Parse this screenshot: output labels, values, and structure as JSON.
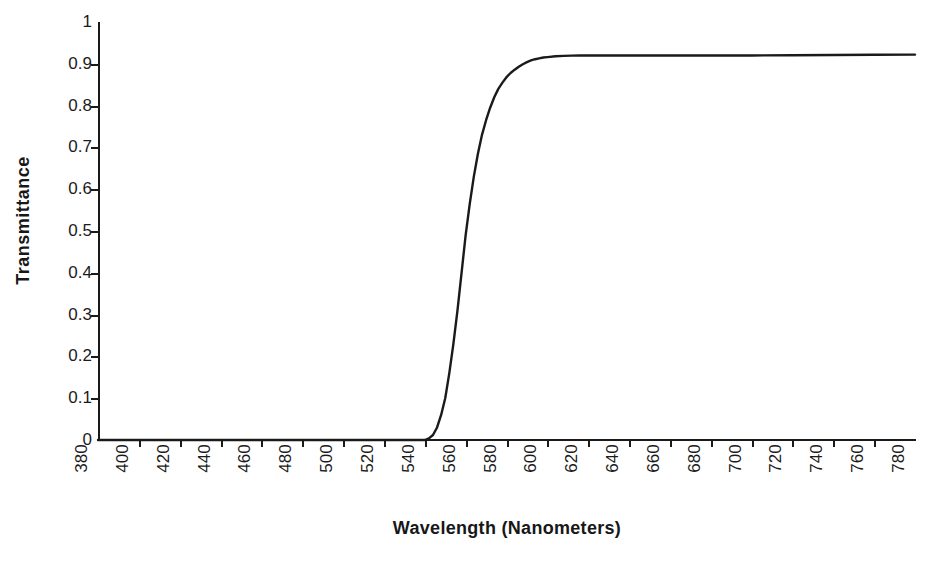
{
  "chart_data": {
    "type": "line",
    "title": "",
    "xlabel": "Wavelength  (Nanometers)",
    "ylabel": "Transmittance",
    "xlim": [
      380,
      780
    ],
    "ylim": [
      0,
      1
    ],
    "grid": false,
    "legend": null,
    "xticks": [
      380,
      400,
      420,
      440,
      460,
      480,
      500,
      520,
      540,
      560,
      580,
      600,
      620,
      640,
      660,
      680,
      700,
      720,
      740,
      760,
      780
    ],
    "xtick_labels": [
      "380",
      "400",
      "420",
      "440",
      "460",
      "480",
      "500",
      "520",
      "540",
      "560",
      "580",
      "600",
      "620",
      "640",
      "660",
      "680",
      "700",
      "720",
      "740",
      "760",
      "780"
    ],
    "yticks": [
      0,
      0.1,
      0.2,
      0.3,
      0.4,
      0.5,
      0.6,
      0.7,
      0.8,
      0.9,
      1
    ],
    "ytick_labels": [
      "0",
      "0.1",
      "0.2",
      "0.3",
      "0.4",
      "0.5",
      "0.6",
      "0.7",
      "0.8",
      "0.9",
      "1"
    ],
    "series": [
      {
        "name": "Transmittance",
        "color": "#1a1a1a",
        "x": [
          380,
          400,
          420,
          440,
          460,
          480,
          500,
          510,
          520,
          530,
          535,
          540,
          542,
          544,
          546,
          548,
          550,
          552,
          554,
          556,
          558,
          560,
          562,
          564,
          566,
          568,
          570,
          572,
          574,
          576,
          578,
          580,
          582,
          584,
          586,
          588,
          590,
          592,
          594,
          596,
          598,
          600,
          604,
          608,
          612,
          616,
          620,
          640,
          660,
          680,
          700,
          720,
          740,
          760,
          780
        ],
        "y": [
          0.0,
          0.0,
          0.0,
          0.0,
          0.0,
          0.0,
          0.0,
          0.0,
          0.0,
          0.0,
          0.0,
          0.0,
          0.004,
          0.012,
          0.03,
          0.06,
          0.1,
          0.16,
          0.23,
          0.31,
          0.4,
          0.49,
          0.565,
          0.63,
          0.685,
          0.73,
          0.765,
          0.795,
          0.82,
          0.84,
          0.855,
          0.868,
          0.878,
          0.886,
          0.893,
          0.899,
          0.904,
          0.908,
          0.911,
          0.913,
          0.915,
          0.916,
          0.918,
          0.919,
          0.9195,
          0.92,
          0.92,
          0.92,
          0.92,
          0.92,
          0.92,
          0.9205,
          0.921,
          0.9215,
          0.922
        ]
      }
    ],
    "annotations": []
  },
  "axes": {
    "y_title": "Transmittance",
    "x_title": "Wavelength  (Nanometers)"
  },
  "style": {
    "axis_color": "#1a1a1a",
    "curve_color": "#1a1a1a",
    "background": "#ffffff",
    "curve_width": 2.4
  }
}
